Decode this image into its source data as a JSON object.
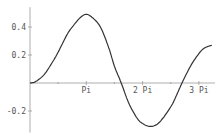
{
  "chart_data": {
    "type": "line",
    "title": "",
    "xlabel": "",
    "ylabel": "",
    "x_unit": "Pi",
    "x_ticks": [
      {
        "value": 1,
        "label": "Pi"
      },
      {
        "value": 2,
        "label": "2 Pi"
      },
      {
        "value": 3,
        "label": "3 Pi"
      }
    ],
    "x_minor_ticks": [
      0.5,
      1.5,
      2.5
    ],
    "y_ticks": [
      {
        "value": 0.4,
        "label": "0.4"
      },
      {
        "value": 0.2,
        "label": "0.2"
      },
      {
        "value": -0.2,
        "label": "-0.2"
      }
    ],
    "xlim": [
      0,
      3.25
    ],
    "ylim": [
      -0.34,
      0.52
    ],
    "grid": false,
    "series": [
      {
        "name": "f(x)",
        "color": "#333333",
        "x": [
          0,
          0.1,
          0.25,
          0.4,
          0.5,
          0.65,
          0.75,
          0.9,
          1.0,
          1.1,
          1.25,
          1.4,
          1.5,
          1.62,
          1.75,
          1.9,
          2.0,
          2.15,
          2.3,
          2.5,
          2.6,
          2.7,
          2.85,
          3.0,
          3.1,
          3.23
        ],
        "y": [
          0,
          0.01,
          0.06,
          0.15,
          0.22,
          0.34,
          0.4,
          0.47,
          0.49,
          0.47,
          0.4,
          0.25,
          0.12,
          0.0,
          -0.14,
          -0.25,
          -0.29,
          -0.31,
          -0.28,
          -0.17,
          -0.09,
          0.0,
          0.12,
          0.21,
          0.25,
          0.27
        ]
      }
    ]
  }
}
